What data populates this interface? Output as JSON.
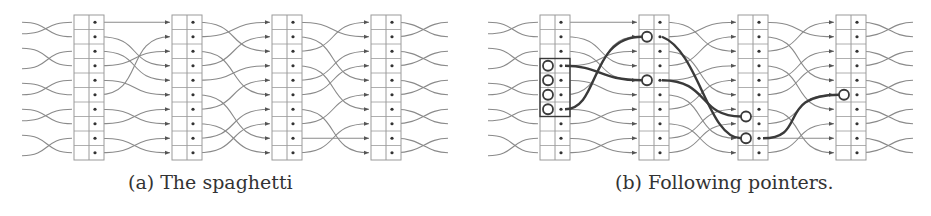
{
  "figure": {
    "subfigures": [
      {
        "id": "a",
        "caption": "(a) The spaghetti"
      },
      {
        "id": "b",
        "caption": "(b) Following pointers."
      }
    ],
    "colors": {
      "line": "#8a8a8a",
      "bold": "#3a3a3a",
      "box": "#9a9a9a",
      "text": "#333333"
    },
    "columns_per_panel": 4,
    "rows_per_column": 10
  }
}
